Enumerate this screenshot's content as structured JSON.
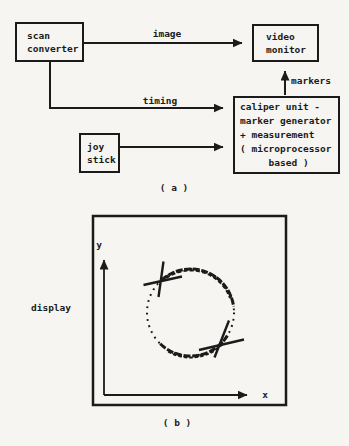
{
  "colors": {
    "ink": "#1b1b1b",
    "paper": "#f6f5f1"
  },
  "part_a": {
    "caption": "( a )",
    "boxes": {
      "scan_converter": "scan\nconverter",
      "video_monitor": "video\nmonitor",
      "caliper_unit": "caliper unit -\nmarker generator\n+ measurement\n( microprocessor\n     based )",
      "joy_stick": "joy\nstick"
    },
    "labels": {
      "image": "image",
      "timing": "timing",
      "markers": "markers"
    }
  },
  "part_b": {
    "caption": "( b )",
    "display_label": "display",
    "x_axis": "x",
    "y_axis": "y"
  }
}
